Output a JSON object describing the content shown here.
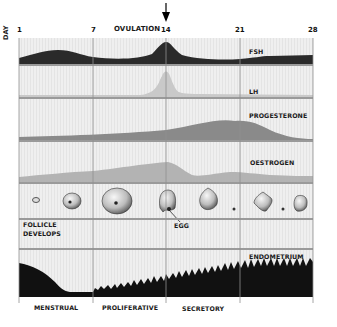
{
  "axis": {
    "label": "DAY",
    "days": [
      "1",
      "7",
      "14",
      "21",
      "28"
    ]
  },
  "ovulation": {
    "label": "OVULATION",
    "day": 14
  },
  "rows": {
    "fsh": {
      "label": "FSH",
      "color": "#2a2a2a"
    },
    "lh": {
      "label": "LH",
      "color": "#c9c9c9"
    },
    "progesterone": {
      "label": "PROGESTERONE",
      "color": "#8a8a8a"
    },
    "oestrogen": {
      "label": "OESTROGEN",
      "color": "#b3b3b3"
    },
    "follicle": {
      "label_line1": "FOLLICLE",
      "label_line2": "DEVELOPS",
      "egg_label": "EGG"
    },
    "endometrium": {
      "label": "ENDOMETRIUM",
      "color": "#111111"
    }
  },
  "phases": [
    "MENSTRUAL",
    "PROLIFERATIVE",
    "SECRETORY"
  ],
  "colors": {
    "panel_bg": "#ececec",
    "separator": "#9a9a9a",
    "gridline": "#8f8f8f"
  }
}
